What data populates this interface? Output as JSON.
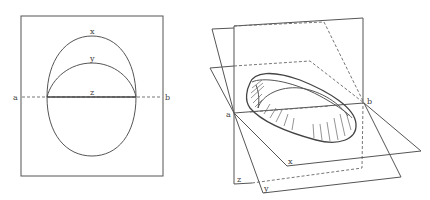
{
  "figure": {
    "left_panel": {
      "labels": {
        "a": "a",
        "b": "b",
        "x": "x",
        "y": "y",
        "z": "z"
      }
    },
    "right_panel": {
      "labels": {
        "a": "a",
        "b": "b",
        "x": "x",
        "y": "y",
        "z": "z"
      }
    }
  },
  "colors": {
    "line": "#555555",
    "background": "#ffffff"
  }
}
